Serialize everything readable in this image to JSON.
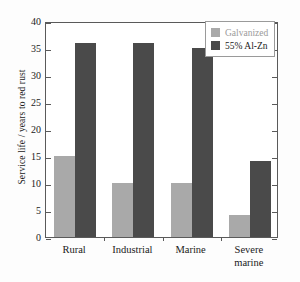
{
  "chart_data": {
    "type": "bar",
    "title": "",
    "xlabel": "",
    "ylabel": "Service life / years to red rust",
    "categories": [
      "Rural",
      "Industrial",
      "Marine",
      "Severe marine"
    ],
    "category_lines": [
      [
        "Rural"
      ],
      [
        "Industrial"
      ],
      [
        "Marine"
      ],
      [
        "Severe",
        "marine"
      ]
    ],
    "series": [
      {
        "name": "Galvanized",
        "color": "#a9a9a9",
        "values": [
          15,
          10,
          10,
          4
        ]
      },
      {
        "name": "55% Al-Zn",
        "color": "#4a4a4a",
        "values": [
          36,
          36,
          35,
          14
        ]
      }
    ],
    "ylim": [
      0,
      40
    ],
    "yticks": [
      0,
      5,
      10,
      15,
      20,
      25,
      30,
      35,
      40
    ],
    "ytick_labels": [
      "0",
      "5",
      "10",
      "15",
      "20",
      "25",
      "30",
      "35",
      "40"
    ],
    "grid": false,
    "legend_position": "top-right"
  },
  "legend": {
    "entries": [
      {
        "label": "Galvanized",
        "color": "#a9a9a9"
      },
      {
        "label": "55% Al-Zn",
        "color": "#4a4a4a"
      }
    ]
  },
  "colors": {
    "galvanized": "#a9a9a9",
    "al_zn": "#4a4a4a",
    "axis": "#5a5a5a",
    "text": "#1a1a1a",
    "background": "#fdfdfd"
  }
}
